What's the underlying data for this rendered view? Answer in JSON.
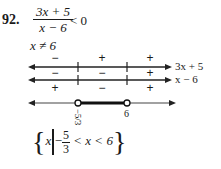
{
  "problem": {
    "number": "92.",
    "numerator": "3x + 5",
    "denominator": "x − 6",
    "relation": "< 0",
    "restriction": "x ≠ 6"
  },
  "sign_chart": {
    "critical_points": [
      "-5/3",
      "6"
    ],
    "rows": [
      {
        "factor": "3x + 5",
        "signs": [
          "−",
          "+",
          "+"
        ]
      },
      {
        "factor": "x − 6",
        "signs": [
          "−",
          "−",
          "+"
        ]
      }
    ],
    "quotient_signs": [
      "+",
      "−",
      "+"
    ],
    "solution_line_labels": [
      "−5/3",
      "6"
    ]
  },
  "answer": {
    "open_brace": "{",
    "var": "x",
    "minus": "−",
    "frac_num": "5",
    "frac_den": "3",
    "rest": " < x < 6",
    "close_brace": "}"
  }
}
